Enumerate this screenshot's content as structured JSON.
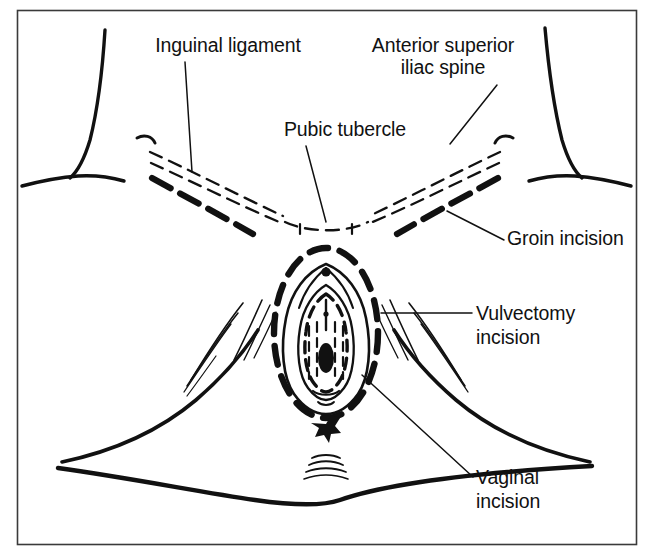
{
  "figure": {
    "background_color": "#ffffff",
    "ink_color": "#111111",
    "frame": {
      "x": 17,
      "y": 10,
      "width": 620,
      "height": 535,
      "border_color": "#3a3a3a"
    }
  },
  "labels": {
    "inguinal_ligament": {
      "text": "Inguinal ligament",
      "x": 228,
      "y": 52,
      "align": "middle"
    },
    "anterior_superior_iliac_spine": {
      "line1": "Anterior superior",
      "line2": "iliac spine",
      "x": 443,
      "y": 52,
      "line2_y": 74,
      "align": "middle"
    },
    "pubic_tubercle": {
      "text": "Pubic tubercle",
      "x": 345,
      "y": 136,
      "align": "middle"
    },
    "groin_incision": {
      "text": "Groin incision",
      "x": 507,
      "y": 245,
      "align": "start"
    },
    "vulvectomy_incision": {
      "line1": "Vulvectomy",
      "line2": "incision",
      "x": 476,
      "y": 320,
      "line2_y": 344,
      "align": "start"
    },
    "vaginal_incision": {
      "line1": "Vaginal",
      "line2": "incision",
      "x": 476,
      "y": 484,
      "line2_y": 508,
      "align": "start"
    }
  },
  "anatomy_parts": [
    {
      "name": "left-torso-flank-contour"
    },
    {
      "name": "right-torso-flank-contour"
    },
    {
      "name": "left-inguinal-ligament-dashed"
    },
    {
      "name": "right-inguinal-ligament-dashed"
    },
    {
      "name": "left-groin-incision-dashed"
    },
    {
      "name": "right-groin-incision-dashed"
    },
    {
      "name": "pubic-symphysis-dashed-arc"
    },
    {
      "name": "vulvectomy-incision-dashed-oval"
    },
    {
      "name": "labia-majora-outline"
    },
    {
      "name": "labia-minora-outline"
    },
    {
      "name": "vaginal-incision-dashed-oval"
    },
    {
      "name": "vaginal-introitus"
    },
    {
      "name": "clitoris"
    },
    {
      "name": "urethral-meatus"
    },
    {
      "name": "anus"
    },
    {
      "name": "perineal-body"
    },
    {
      "name": "left-thigh-contour"
    },
    {
      "name": "right-thigh-contour"
    },
    {
      "name": "gluteal-fold-contour"
    }
  ],
  "leader_lines": [
    {
      "name": "leader-inguinal-ligament"
    },
    {
      "name": "leader-anterior-superior-iliac-spine"
    },
    {
      "name": "leader-pubic-tubercle"
    },
    {
      "name": "leader-groin-incision"
    },
    {
      "name": "leader-vulvectomy-incision"
    },
    {
      "name": "leader-vaginal-incision"
    }
  ]
}
